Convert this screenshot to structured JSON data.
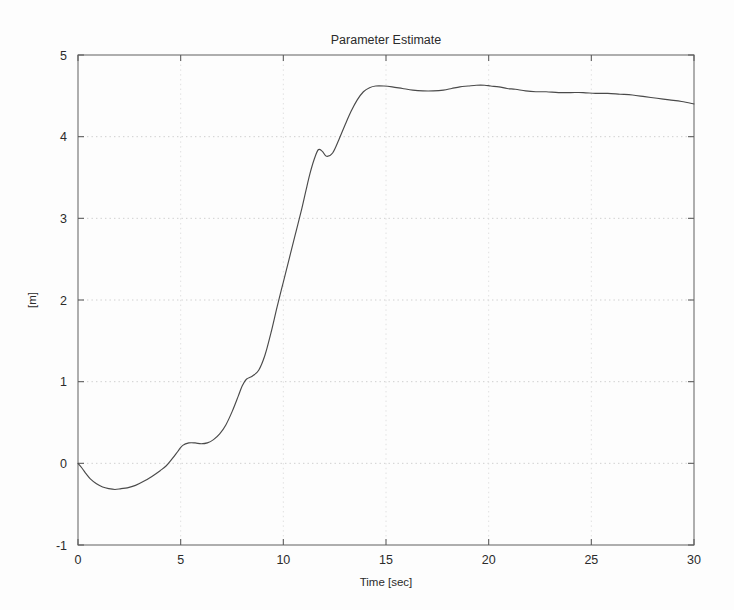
{
  "chart_data": {
    "type": "line",
    "title": "Parameter Estimate",
    "xlabel": "Time [sec]",
    "ylabel": "[m]",
    "xlim": [
      0,
      30
    ],
    "ylim": [
      -1,
      5
    ],
    "xticks": [
      0,
      5,
      10,
      15,
      20,
      25,
      30
    ],
    "yticks": [
      -1,
      0,
      1,
      2,
      3,
      4,
      5
    ],
    "xtick_labels": [
      "0",
      "5",
      "10",
      "15",
      "20",
      "25",
      "30"
    ],
    "ytick_labels": [
      "-1",
      "0",
      "1",
      "2",
      "3",
      "4",
      "5"
    ],
    "grid": true,
    "grid_style": "dotted",
    "legend": null,
    "series": [
      {
        "name": "parameter estimate",
        "color": "#4a4a4a",
        "x": [
          0.0,
          0.2,
          0.4,
          0.6,
          0.9,
          1.2,
          1.5,
          1.8,
          2.1,
          2.4,
          2.8,
          3.2,
          3.6,
          4.0,
          4.3,
          4.6,
          4.9,
          5.1,
          5.4,
          5.7,
          6.0,
          6.3,
          6.6,
          6.9,
          7.2,
          7.5,
          7.8,
          8.0,
          8.2,
          8.5,
          8.8,
          9.1,
          9.4,
          9.7,
          10.0,
          10.3,
          10.6,
          10.9,
          11.1,
          11.3,
          11.5,
          11.7,
          11.9,
          12.1,
          12.4,
          12.7,
          13.0,
          13.3,
          13.6,
          13.9,
          14.2,
          14.5,
          14.9,
          15.3,
          15.8,
          16.3,
          16.8,
          17.3,
          17.8,
          18.2,
          18.6,
          19.0,
          19.4,
          19.8,
          20.1,
          20.5,
          20.9,
          21.3,
          21.8,
          22.3,
          22.8,
          23.4,
          24.0,
          24.6,
          25.2,
          25.8,
          26.4,
          27.0,
          27.6,
          28.2,
          28.8,
          29.4,
          30.0
        ],
        "y": [
          0.0,
          -0.06,
          -0.13,
          -0.19,
          -0.25,
          -0.29,
          -0.31,
          -0.32,
          -0.31,
          -0.3,
          -0.27,
          -0.22,
          -0.16,
          -0.09,
          -0.03,
          0.06,
          0.16,
          0.22,
          0.25,
          0.25,
          0.24,
          0.25,
          0.29,
          0.36,
          0.47,
          0.63,
          0.82,
          0.95,
          1.03,
          1.07,
          1.14,
          1.32,
          1.6,
          1.92,
          2.22,
          2.52,
          2.82,
          3.12,
          3.34,
          3.55,
          3.72,
          3.84,
          3.82,
          3.76,
          3.8,
          3.96,
          4.14,
          4.31,
          4.45,
          4.55,
          4.6,
          4.62,
          4.62,
          4.61,
          4.59,
          4.57,
          4.56,
          4.56,
          4.57,
          4.59,
          4.61,
          4.62,
          4.63,
          4.63,
          4.62,
          4.61,
          4.59,
          4.58,
          4.56,
          4.55,
          4.55,
          4.54,
          4.54,
          4.54,
          4.53,
          4.53,
          4.52,
          4.51,
          4.49,
          4.47,
          4.45,
          4.43,
          4.4
        ]
      }
    ]
  },
  "geometry": {
    "plot_left": 78,
    "plot_right": 694,
    "plot_top": 55,
    "plot_bottom": 545
  }
}
